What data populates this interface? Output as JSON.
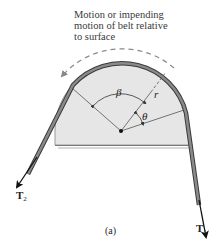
{
  "figure": {
    "annotation": {
      "line1": "Motion or impending",
      "line2": "motion of belt relative",
      "line3": "to surface"
    },
    "labels": {
      "beta": "β",
      "theta": "θ",
      "r": "r",
      "T1_main": "T",
      "T1_sub": "1",
      "T2_main": "T",
      "T2_sub": "2"
    },
    "caption": "(a)",
    "colors": {
      "drum_fill": "#e6e6e6",
      "drum_edge": "#9a9a9a",
      "belt": "#6e6e6e",
      "belt_edge": "#3a3a3a",
      "arrow": "#111111",
      "dashed_arrow": "#8a8a8a",
      "text": "#333333"
    }
  }
}
